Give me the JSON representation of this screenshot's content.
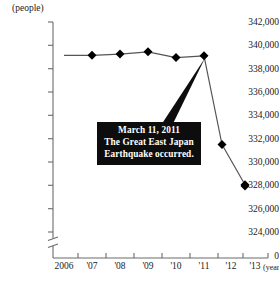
{
  "chart_data": {
    "type": "line",
    "title": "",
    "subtitle": "",
    "ylabel": "(people)",
    "xlabel": "(year)",
    "categories": [
      "2006",
      "'07",
      "'08",
      "'09",
      "'10",
      "'11",
      "'12",
      "'13"
    ],
    "x": [
      2006,
      2007,
      2008,
      2009,
      2010,
      2011,
      2012,
      2013
    ],
    "values": [
      339150,
      339150,
      339250,
      339450,
      338950,
      339100,
      331500,
      328050
    ],
    "series": [
      {
        "name": "Population",
        "values": [
          339150,
          339150,
          339250,
          339450,
          338950,
          339100,
          331500,
          328050
        ]
      }
    ],
    "ylim": [
      324000,
      342000
    ],
    "ytick_values": [
      342000,
      340000,
      338000,
      336000,
      334000,
      332000,
      330000,
      328000,
      326000,
      324000
    ],
    "ytick_labels": [
      "342,000",
      "340,000",
      "338,000",
      "336,000",
      "334,000",
      "332,000",
      "330,000",
      "328,000",
      "326,000",
      "324,000"
    ],
    "axis_break": true,
    "axis_origin_label": "0",
    "grid": false,
    "legend": "none",
    "marker": "diamond",
    "line_color": "#555555",
    "marker_color": "#000000",
    "annotations": [
      {
        "id": "earthquake-callout",
        "lines": [
          "March 11, 2011",
          "The Great East Japan",
          "Earthquake occurred."
        ],
        "background_color": "#0d0d0d",
        "text_color": "#ffffff",
        "points_to_year": 2011
      }
    ]
  }
}
